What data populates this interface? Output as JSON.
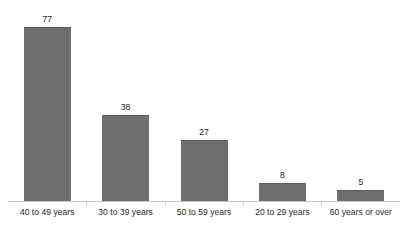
{
  "chart_data": {
    "type": "bar",
    "title": "",
    "subtitle": "",
    "xlabel": "",
    "ylabel": "",
    "categories": [
      "40 to 49 years",
      "30 to 39 years",
      "50 to 59 years",
      "20 to 29 years",
      "60 years or over"
    ],
    "values": [
      77,
      38,
      27,
      8,
      5
    ],
    "value_labels": [
      "77",
      "38",
      "27",
      "8",
      "5"
    ],
    "ylim": [
      0,
      77
    ],
    "grid": false,
    "legend": false,
    "legend_position": "none",
    "y_axis_visible": false,
    "x_axis_visible": true,
    "data_labels_position": "above-bar",
    "orientation": "vertical",
    "colors": {
      "bar_fill": "#6e6e6e",
      "bar_top_edge": "#5c5c5c",
      "axis_line": "#c8c8c8",
      "tick": "#d2d2d2",
      "value_text": "#1a1a1a",
      "category_text": "#1f1f1f",
      "background": "#ffffff"
    }
  }
}
